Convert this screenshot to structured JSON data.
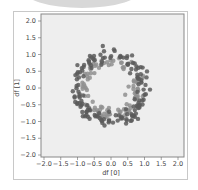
{
  "chart_data": {
    "type": "scatter",
    "title": "",
    "xlabel": "df [0]",
    "ylabel": "df [1]",
    "xlim": [
      -2.1,
      2.1
    ],
    "ylim": [
      -2.1,
      2.1
    ],
    "xticks": [
      "-2.0",
      "-1.5",
      "-1.0",
      "-0.5",
      "0.0",
      "0.5",
      "1.0",
      "1.5",
      "2.0"
    ],
    "yticks": [
      "2.0",
      "1.5",
      "1.0",
      "0.5",
      "0.0",
      "-0.5",
      "-1.0",
      "-1.5",
      "-2.0"
    ],
    "grid": false,
    "legend": null,
    "series": [
      {
        "name": "outer ring",
        "color": "#5a5a5a",
        "radius": 1.0,
        "noise": 0.1,
        "count": 150
      },
      {
        "name": "inner ring",
        "color": "#8f8f8f",
        "radius": 0.8,
        "noise": 0.1,
        "count": 100
      }
    ],
    "colors": {
      "plot_background": "#eeeeee",
      "frame_border": "#c8c8c8",
      "axes_border": "#888888"
    }
  }
}
